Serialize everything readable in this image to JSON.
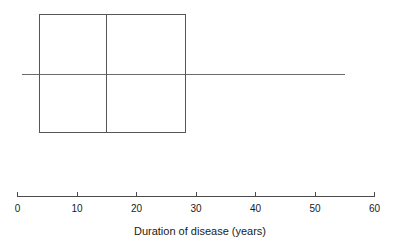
{
  "chart_data": {
    "type": "box",
    "title": "",
    "subtitle": "",
    "xlabel": "Duration of disease (years)",
    "ylabel": "",
    "xlim": [
      0,
      60
    ],
    "xticks": [
      0,
      10,
      20,
      30,
      40,
      50,
      60
    ],
    "xticklabels": [
      "0",
      "10",
      "20",
      "30",
      "40",
      "50",
      "60"
    ],
    "grid": false,
    "legend": null,
    "orientation": "horizontal",
    "boxes": [
      {
        "name": "Duration of disease",
        "whisker_low": 0.8,
        "q1": 3.7,
        "median": 15.0,
        "q3": 28.3,
        "whisker_high": 55.1,
        "outliers": []
      }
    ],
    "annotations": []
  },
  "style": {
    "background": "#ffffff",
    "box_stroke": "#565656",
    "median_stroke": "#565656",
    "whisker_stroke": "#6b6b6b",
    "axis_stroke": "#4a4a4a",
    "text_color": "#1a1a1a"
  },
  "ticks": {
    "t0": "0",
    "t1": "10",
    "t2": "20",
    "t3": "30",
    "t4": "40",
    "t5": "50",
    "t6": "60"
  },
  "labels": {
    "xaxis_title": "Duration of disease (years)"
  }
}
